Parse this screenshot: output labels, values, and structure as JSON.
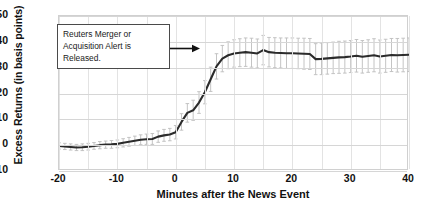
{
  "chart_data": {
    "type": "line",
    "title": "",
    "xlabel": "Minutes after the News Event",
    "ylabel": "Excess Returns (in basis points)",
    "xlim": [
      -20,
      40
    ],
    "ylim": [
      -10,
      50
    ],
    "xticks": [
      -20,
      -10,
      0,
      10,
      20,
      30,
      40
    ],
    "yticks": [
      -10,
      0,
      10,
      20,
      30,
      40,
      50
    ],
    "grid": true,
    "grid_step_x": 5,
    "grid_step_y": 10,
    "legend": "none",
    "line_color": "#2b2b2b",
    "errorbar_color": "#bdbdbd",
    "event_line_x": 0,
    "annotation": {
      "text": "Reuters Merger or Acquisition Alert is Released.",
      "points_to_x": 0
    },
    "series": [
      {
        "name": "Excess Returns",
        "x": [
          -20,
          -19,
          -18,
          -17,
          -16,
          -15,
          -14,
          -13,
          -12,
          -11,
          -10,
          -9,
          -8,
          -7,
          -6,
          -5,
          -4,
          -3,
          -2,
          -1,
          0,
          1,
          2,
          3,
          4,
          5,
          6,
          7,
          8,
          9,
          10,
          11,
          12,
          13,
          14,
          15,
          16,
          17,
          18,
          19,
          20,
          21,
          22,
          23,
          24,
          25,
          26,
          27,
          28,
          29,
          30,
          31,
          32,
          33,
          34,
          35,
          36,
          37,
          38,
          39,
          40
        ],
        "y": [
          -0.3,
          -0.5,
          -0.7,
          -0.9,
          -0.8,
          -0.6,
          -0.3,
          0.0,
          0.2,
          0.3,
          0.5,
          0.9,
          1.3,
          1.7,
          2.1,
          2.3,
          2.4,
          3.3,
          3.8,
          4.1,
          5.0,
          9.0,
          12.5,
          13.5,
          16.5,
          20.5,
          25.5,
          30.5,
          33.5,
          34.8,
          35.5,
          35.8,
          36.0,
          35.8,
          35.5,
          36.8,
          36.0,
          35.8,
          35.7,
          35.6,
          35.6,
          35.5,
          35.4,
          35.3,
          33.3,
          33.4,
          33.6,
          33.8,
          34.0,
          34.1,
          34.3,
          34.6,
          34.2,
          34.5,
          34.8,
          34.3,
          34.6,
          34.9,
          34.8,
          34.9,
          35.0
        ],
        "yerr": [
          1.2,
          1.2,
          1.2,
          1.2,
          1.3,
          1.3,
          1.3,
          1.4,
          1.4,
          1.5,
          1.5,
          1.6,
          1.7,
          1.8,
          1.9,
          2.0,
          2.1,
          2.2,
          2.3,
          2.4,
          2.6,
          3.2,
          3.6,
          3.9,
          4.2,
          4.5,
          4.7,
          4.9,
          5.1,
          5.2,
          5.3,
          5.4,
          5.5,
          5.6,
          5.6,
          5.7,
          5.7,
          5.8,
          5.8,
          5.9,
          5.9,
          5.9,
          6.0,
          6.0,
          6.0,
          6.1,
          6.1,
          6.1,
          6.2,
          6.2,
          6.2,
          6.3,
          6.3,
          6.3,
          6.4,
          6.4,
          6.4,
          6.4,
          6.5,
          6.5,
          6.5
        ]
      }
    ]
  }
}
